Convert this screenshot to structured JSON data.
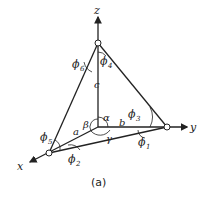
{
  "diagram": {
    "axes": {
      "x_label": "x",
      "y_label": "y",
      "z_label": "z"
    },
    "edges": {
      "a": "a",
      "b": "b",
      "c": "c"
    },
    "angles": {
      "alpha": "α",
      "beta": "β",
      "gamma": "γ"
    },
    "dihedral_angles": {
      "phi1": "ϕ",
      "phi1_sub": "1",
      "phi2": "ϕ",
      "phi2_sub": "2",
      "phi3": "ϕ",
      "phi3_sub": "3",
      "phi4": "ϕ",
      "phi4_sub": "4",
      "phi5": "ϕ",
      "phi5_sub": "5",
      "phi6": "ϕ",
      "phi6_sub": "6"
    },
    "caption": "(a)"
  }
}
